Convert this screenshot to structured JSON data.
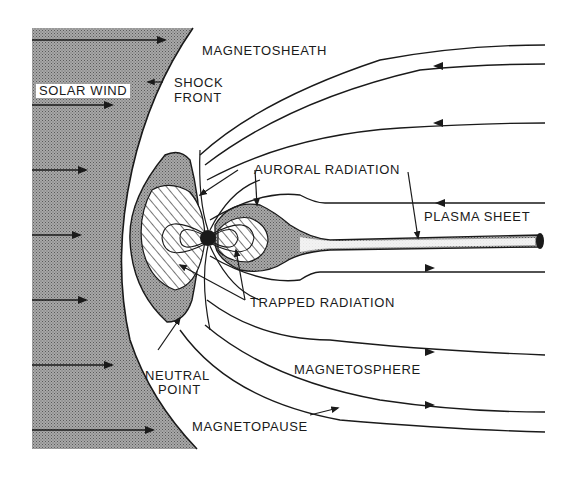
{
  "figure": {
    "labels": {
      "magnetosheath": "MAGNETOSHEATH",
      "solar_wind": "SOLAR WIND",
      "shock_front_line1": "SHOCK",
      "shock_front_line2": "FRONT",
      "auroral_radiation": "AURORAL RADIATION",
      "plasma_sheet": "PLASMA SHEET",
      "trapped_radiation": "TRAPPED RADIATION",
      "neutral_point_line1": "NEUTRAL",
      "neutral_point_line2": "POINT",
      "magnetosphere": "MAGNETOSPHERE",
      "magnetopause": "MAGNETOPAUSE"
    },
    "colors": {
      "ink": "#1a1a1a",
      "stipple": "#8a8a8a",
      "background": "#ffffff"
    }
  }
}
